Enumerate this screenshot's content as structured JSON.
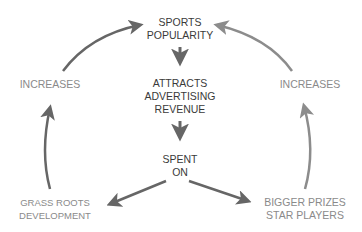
{
  "diagram": {
    "type": "cycle-flow",
    "nodes": {
      "top": {
        "line1": "SPORTS",
        "line2": "POPULARITY"
      },
      "middle": {
        "line1": "ATTRACTS",
        "line2": "ADVERTISING",
        "line3": "REVENUE"
      },
      "spent": {
        "line1": "SPENT",
        "line2": "ON"
      },
      "left_bottom": {
        "line1": "GRASS ROOTS",
        "line2": "DEVELOPMENT"
      },
      "right_bottom": {
        "line1": "BIGGER PRIZES",
        "line2": "STAR PLAYERS"
      },
      "left_increases": {
        "label": "INCREASES"
      },
      "right_increases": {
        "label": "INCREASES"
      }
    },
    "edges": [
      {
        "from": "SPORTS POPULARITY",
        "to": "ATTRACTS ADVERTISING REVENUE"
      },
      {
        "from": "ATTRACTS ADVERTISING REVENUE",
        "to": "SPENT ON"
      },
      {
        "from": "SPENT ON",
        "to": "GRASS ROOTS DEVELOPMENT"
      },
      {
        "from": "SPENT ON",
        "to": "BIGGER PRIZES STAR PLAYERS"
      },
      {
        "from": "GRASS ROOTS DEVELOPMENT",
        "to": "INCREASES (left)"
      },
      {
        "from": "INCREASES (left)",
        "to": "SPORTS POPULARITY"
      },
      {
        "from": "BIGGER PRIZES STAR PLAYERS",
        "to": "INCREASES (right)"
      },
      {
        "from": "INCREASES (right)",
        "to": "SPORTS POPULARITY"
      }
    ],
    "colors": {
      "dark_text": "#3a3a3a",
      "light_text": "#8a8a8a",
      "arrow": "#666666",
      "arrow_light": "#8c8c8c"
    }
  }
}
